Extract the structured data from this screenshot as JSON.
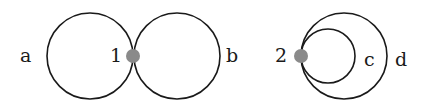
{
  "diagram": {
    "figures": [
      {
        "vertex": {
          "label": "1",
          "color": "#8a8a8a"
        },
        "loops": [
          {
            "label": "a",
            "position": "left"
          },
          {
            "label": "b",
            "position": "right"
          }
        ],
        "arrangement": "two loops meeting externally at vertex 1"
      },
      {
        "vertex": {
          "label": "2",
          "color": "#8a8a8a"
        },
        "loops": [
          {
            "label": "c",
            "position": "inner"
          },
          {
            "label": "d",
            "position": "outer"
          }
        ],
        "arrangement": "two nested loops tangent internally at vertex 2"
      }
    ]
  }
}
